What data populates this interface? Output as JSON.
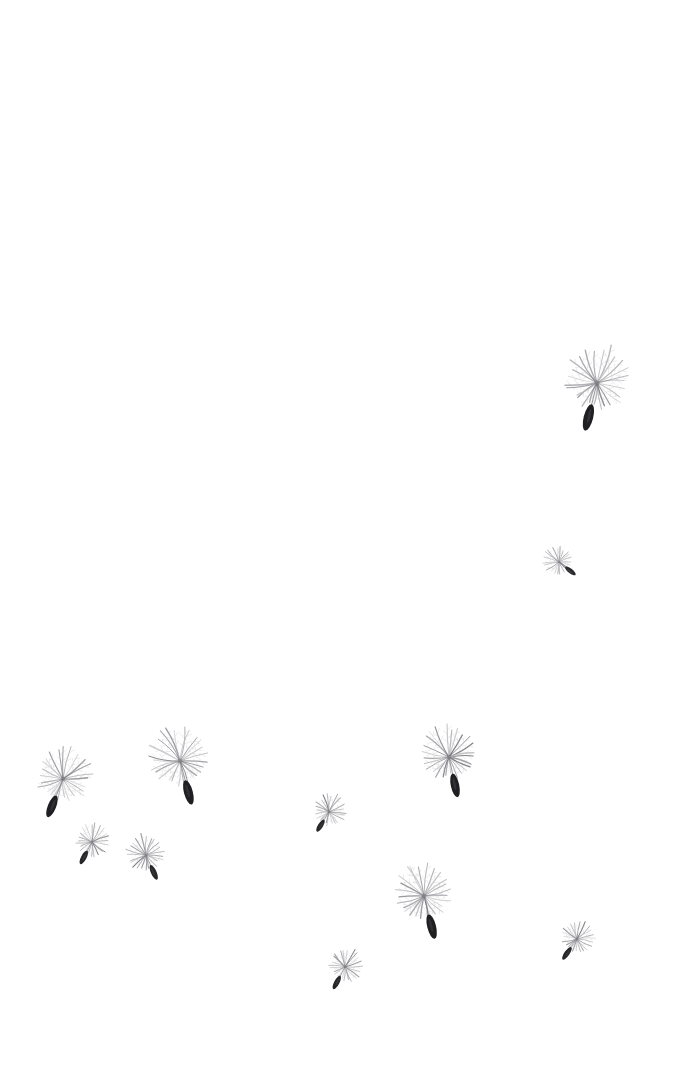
{
  "scene": {
    "title": "Dandelion seeds drifting",
    "subject": "dandelion-seeds",
    "width": 688,
    "height": 1073,
    "background_color": "#ffffff",
    "object_count": 11,
    "composition_note": "Upper two thirds of frame are empty white; seeds cluster toward the lower left, lower middle and right edge.",
    "palette": {
      "background": "#ffffff",
      "filament_light": "#b9b9bd",
      "filament_mid": "#8e8e94",
      "filament_dark": "#6f6f75",
      "seed_body": "#141417",
      "seed_body_highlight": "#3a3a40"
    }
  },
  "legend": {
    "object_label": "dandelion-seed",
    "part_labels": {
      "pappus": "pappus (feathery parachute)",
      "filaments": "pappus filaments",
      "achene": "achene (dark seed body)",
      "beak": "beak (stalk linking seed to pappus)"
    }
  },
  "seeds": [
    {
      "id": "seed-1",
      "name": "seed-top-right-large",
      "cx": 597,
      "cy": 383,
      "pappus_radius": 37,
      "filament_count": 26,
      "filament_width": 1.15,
      "seed_angle_deg": 104,
      "beak_length": 22,
      "body_length": 27,
      "body_width": 9.5,
      "opacity": 0.95,
      "size_class": "large"
    },
    {
      "id": "seed-2",
      "name": "seed-right-small",
      "cx": 559,
      "cy": 562,
      "pappus_radius": 16,
      "filament_count": 22,
      "filament_width": 0.85,
      "seed_angle_deg": 38,
      "beak_length": 8,
      "body_length": 13,
      "body_width": 4.6,
      "opacity": 0.9,
      "size_class": "small"
    },
    {
      "id": "seed-3",
      "name": "seed-left-upper-large",
      "cx": 63,
      "cy": 779,
      "pappus_radius": 32,
      "filament_count": 25,
      "filament_width": 1.1,
      "seed_angle_deg": 112,
      "beak_length": 18,
      "body_length": 23,
      "body_width": 8.2,
      "opacity": 0.95,
      "size_class": "large"
    },
    {
      "id": "seed-4",
      "name": "seed-left-mid-large",
      "cx": 180,
      "cy": 761,
      "pappus_radius": 34,
      "filament_count": 26,
      "filament_width": 1.1,
      "seed_angle_deg": 75,
      "beak_length": 20,
      "body_length": 25,
      "body_width": 8.8,
      "opacity": 0.95,
      "size_class": "large"
    },
    {
      "id": "seed-5",
      "name": "seed-left-lower-small",
      "cx": 92,
      "cy": 842,
      "pappus_radius": 19,
      "filament_count": 23,
      "filament_width": 0.9,
      "seed_angle_deg": 118,
      "beak_length": 10,
      "body_length": 15,
      "body_width": 5.4,
      "opacity": 0.92,
      "size_class": "medium"
    },
    {
      "id": "seed-6",
      "name": "seed-left-lower-medium",
      "cx": 146,
      "cy": 855,
      "pappus_radius": 21,
      "filament_count": 24,
      "filament_width": 0.9,
      "seed_angle_deg": 66,
      "beak_length": 11,
      "body_length": 16,
      "body_width": 5.6,
      "opacity": 0.92,
      "size_class": "medium"
    },
    {
      "id": "seed-7",
      "name": "seed-center-small",
      "cx": 329,
      "cy": 812,
      "pappus_radius": 18,
      "filament_count": 23,
      "filament_width": 0.88,
      "seed_angle_deg": 122,
      "beak_length": 9,
      "body_length": 14,
      "body_width": 5.0,
      "opacity": 0.92,
      "size_class": "small"
    },
    {
      "id": "seed-8",
      "name": "seed-right-upper-large",
      "cx": 449,
      "cy": 757,
      "pappus_radius": 31,
      "filament_count": 26,
      "filament_width": 1.1,
      "seed_angle_deg": 78,
      "beak_length": 17,
      "body_length": 24,
      "body_width": 8.4,
      "opacity": 0.95,
      "size_class": "large"
    },
    {
      "id": "seed-9",
      "name": "seed-bottom-center-large",
      "cx": 424,
      "cy": 896,
      "pappus_radius": 33,
      "filament_count": 26,
      "filament_width": 1.1,
      "seed_angle_deg": 76,
      "beak_length": 19,
      "body_length": 25,
      "body_width": 8.8,
      "opacity": 0.95,
      "size_class": "large"
    },
    {
      "id": "seed-10",
      "name": "seed-bottom-left-small",
      "cx": 345,
      "cy": 967,
      "pappus_radius": 19,
      "filament_count": 23,
      "filament_width": 0.9,
      "seed_angle_deg": 118,
      "beak_length": 10,
      "body_length": 15,
      "body_width": 5.2,
      "opacity": 0.92,
      "size_class": "small"
    },
    {
      "id": "seed-11",
      "name": "seed-bottom-right-small",
      "cx": 577,
      "cy": 939,
      "pappus_radius": 19,
      "filament_count": 23,
      "filament_width": 0.9,
      "seed_angle_deg": 125,
      "beak_length": 10,
      "body_length": 15,
      "body_width": 5.2,
      "opacity": 0.92,
      "size_class": "small"
    }
  ]
}
